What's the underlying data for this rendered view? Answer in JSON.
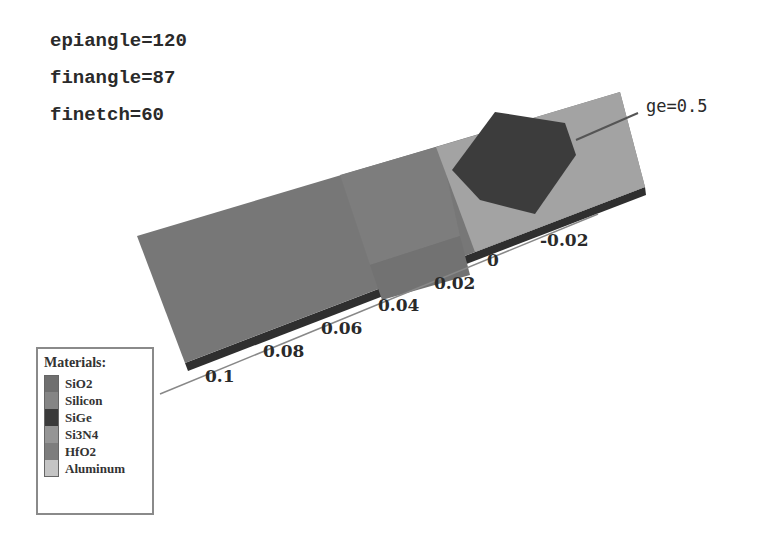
{
  "parameters": [
    {
      "label": "epiangle=120"
    },
    {
      "label": "finangle=87"
    },
    {
      "label": "finetch=60"
    }
  ],
  "annotation": {
    "label": "ge=0.5"
  },
  "axis": {
    "name": "Z",
    "ticks": [
      "0.1",
      "0.08",
      "0.06",
      "0.04",
      "0.02",
      "0",
      "-0.02"
    ]
  },
  "legend": {
    "title": "Materials:",
    "items": [
      {
        "label": "SiO2",
        "color": "#6f6f6f"
      },
      {
        "label": "Silicon",
        "color": "#858585"
      },
      {
        "label": "SiGe",
        "color": "#3a3a3a"
      },
      {
        "label": "Si3N4",
        "color": "#959595"
      },
      {
        "label": "HfO2",
        "color": "#7d7d7d"
      },
      {
        "label": "Aluminum",
        "color": "#c4c4c4"
      }
    ]
  },
  "colors": {
    "body_main": "#757575",
    "aluminum": "#a0a0a0",
    "sige": "#3c3c3c",
    "edge": "#2f2f2f"
  }
}
